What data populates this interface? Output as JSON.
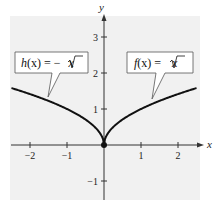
{
  "chart_data": {
    "type": "line",
    "title": "",
    "xlabel": "x",
    "ylabel": "y",
    "xlim": [
      -2.5,
      2.5
    ],
    "ylim": [
      -1.5,
      3.5
    ],
    "xticks": [
      -2,
      -1,
      1,
      2
    ],
    "yticks": [
      -1,
      1,
      2,
      3
    ],
    "xtick_labels": [
      "−2",
      "−1",
      "1",
      "2"
    ],
    "ytick_labels": [
      "−1",
      "1",
      "2",
      "3"
    ],
    "grid": false,
    "series": [
      {
        "name": "f(x) = √x",
        "label_math": "f(x) = √x",
        "domain": [
          0,
          2.5
        ],
        "x": [
          0,
          0.25,
          0.5,
          1,
          1.5,
          2,
          2.5
        ],
        "values": [
          0,
          0.5,
          0.707,
          1,
          1.225,
          1.414,
          1.581
        ]
      },
      {
        "name": "h(x) = √(−x)",
        "label_math": "h(x) = −√x",
        "domain": [
          -2.5,
          0
        ],
        "x": [
          -2.5,
          -2,
          -1.5,
          -1,
          -0.5,
          -0.25,
          0
        ],
        "values": [
          1.581,
          1.414,
          1.225,
          1,
          0.707,
          0.5,
          0
        ]
      }
    ],
    "annotations": [
      {
        "text": "h(x) = −√x",
        "points_to_x": -1.5
      },
      {
        "text": "f(x) = √x",
        "points_to_x": 1.3
      }
    ],
    "origin_point": {
      "x": 0,
      "y": 0
    }
  },
  "callouts": {
    "left": {
      "prefix": "h",
      "mid": "(x) = −",
      "rad": "x"
    },
    "right": {
      "prefix": "f",
      "mid": "(x) = ",
      "rad": "x"
    }
  }
}
